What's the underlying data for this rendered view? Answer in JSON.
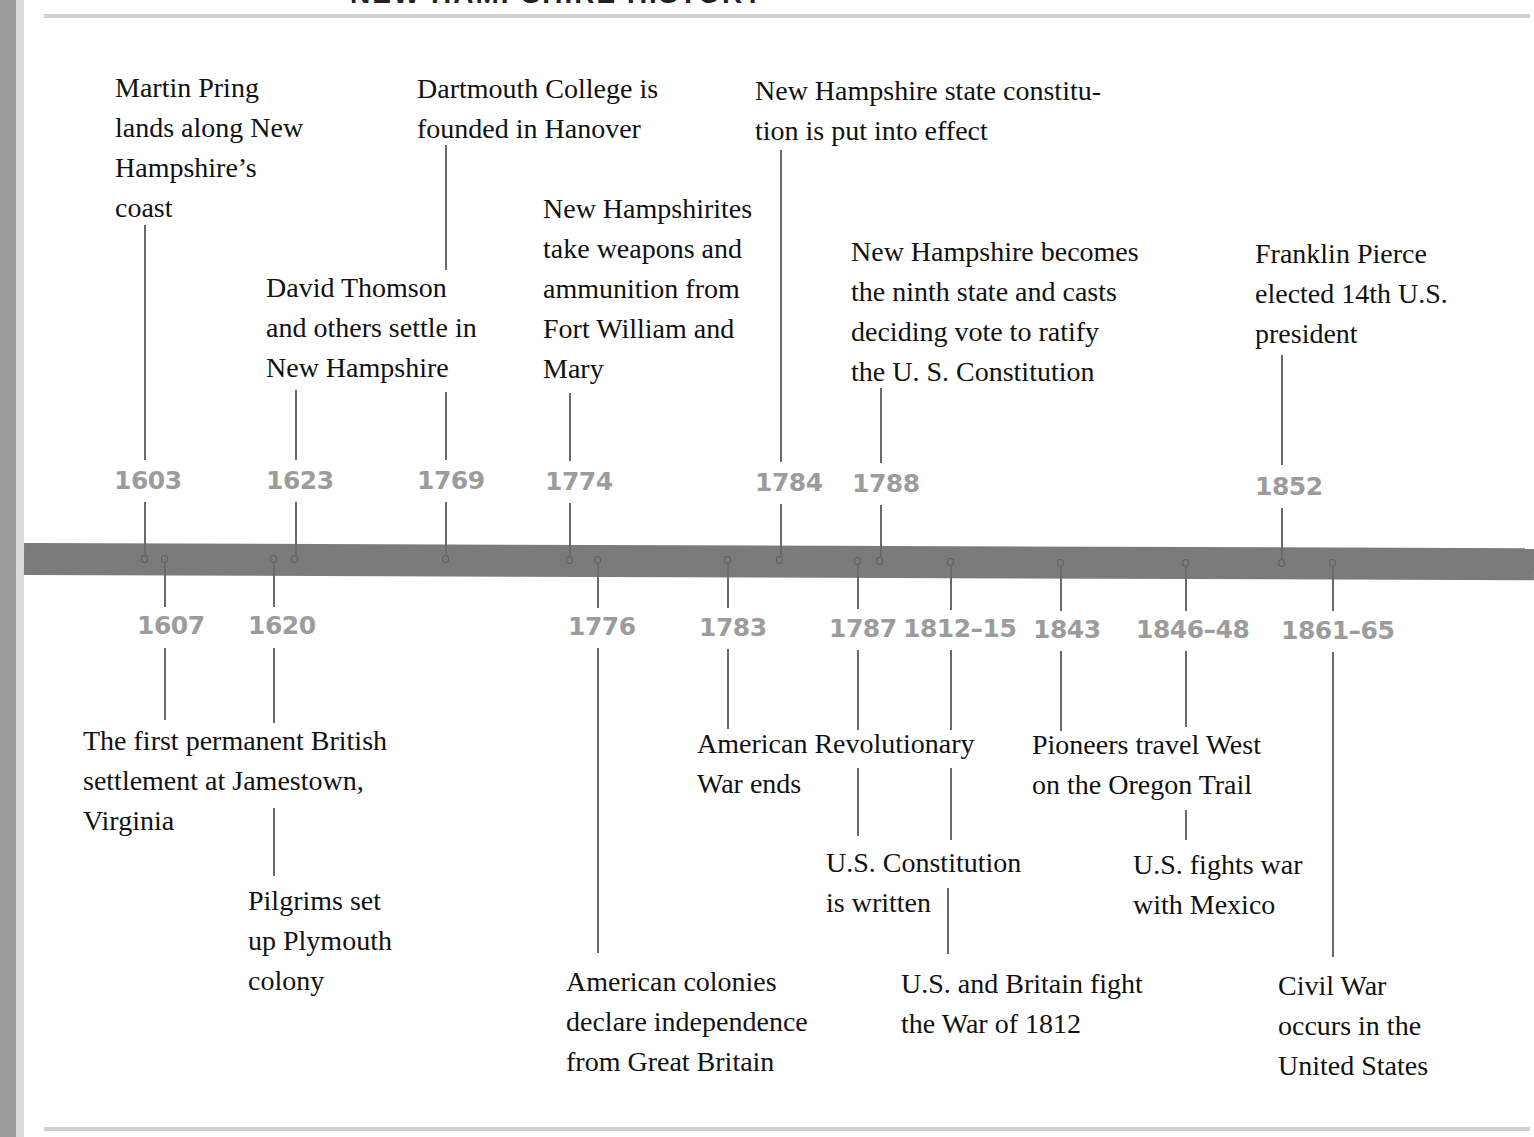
{
  "title": "NEW HAMPSHIRE HISTORY",
  "colors": {
    "bar": "#7b7b7b",
    "year_label": "#9c9c9c",
    "event_text": "#111111",
    "connector": "#6a6a6a"
  },
  "above_events": [
    {
      "year": "1603",
      "text": "Martin Pring\nlands along New\nHampshire’s\ncoast"
    },
    {
      "year": "1623",
      "text": "David Thomson\nand others settle in\nNew Hampshire"
    },
    {
      "year": "1769",
      "text": "Dartmouth College is\nfounded in Hanover"
    },
    {
      "year": "1774",
      "text": "New Hampshirites\ntake weapons and\nammunition from\nFort William and\nMary"
    },
    {
      "year": "1784",
      "text": "New Hampshire state constitu-\ntion is put into effect"
    },
    {
      "year": "1788",
      "text": "New Hampshire becomes\nthe ninth state and casts\ndeciding vote to ratify\nthe U. S. Constitution"
    },
    {
      "year": "1852",
      "text": "Franklin Pierce\nelected 14th U.S.\npresident"
    }
  ],
  "below_events": [
    {
      "year": "1607",
      "text": "The first permanent British\nsettlement at Jamestown,\nVirginia"
    },
    {
      "year": "1620",
      "text": "Pilgrims set\nup Plymouth\ncolony"
    },
    {
      "year": "1776",
      "text": "American colonies\ndeclare independence\nfrom Great Britain"
    },
    {
      "year": "1783",
      "text": "American Revolutionary\nWar ends"
    },
    {
      "year": "1787",
      "text": "U.S. Constitution\nis written"
    },
    {
      "year": "1812–15",
      "text": "U.S. and Britain fight\nthe War of 1812"
    },
    {
      "year": "1843",
      "text": "Pioneers travel West\non the Oregon Trail"
    },
    {
      "year": "1846–48",
      "text": "U.S. fights war\nwith Mexico"
    },
    {
      "year": "1861–65",
      "text": "Civil War\noccurs in the\nUnited States"
    }
  ]
}
